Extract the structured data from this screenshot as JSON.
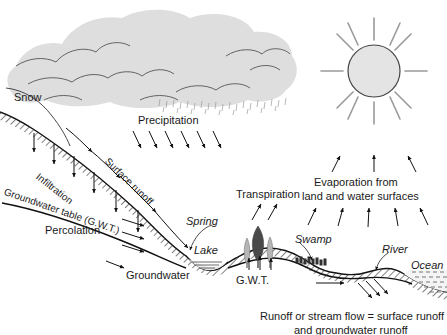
{
  "diagram": {
    "width": 447,
    "height": 335,
    "background_color": "#ffffff",
    "ink_color": "#1a1a1a"
  },
  "labels": {
    "snow": "Snow",
    "precipitation": "Precipitation",
    "infiltration": "Infiltration",
    "surface_runoff": "Surface runoff",
    "groundwater_table": "Groundwater table (G.W.T.)",
    "percolation": "Percolation",
    "groundwater": "Groundwater",
    "spring": "Spring",
    "lake": "Lake",
    "transpiration": "Transpiration",
    "evaporation_line1": "Evaporation from",
    "evaporation_line2": "land and water surfaces",
    "gwt_right": "G.W.T.",
    "swamp": "Swamp",
    "river": "River",
    "ocean": "Ocean",
    "caption_line1": "Runoff or stream flow = surface runoff",
    "caption_line2": "and groundwater runoff"
  },
  "elements": {
    "cloud": {
      "name": "cloud",
      "fill_color": "#dedede",
      "outline_color": "#555555"
    },
    "sun": {
      "name": "sun",
      "fill_color": "#e4e4e4",
      "outline_color": "#444444",
      "ray_color": "#9a9a9a",
      "ray_count": 12,
      "center_x": 374,
      "center_y": 71,
      "radius": 26
    },
    "trees": {
      "count": 3,
      "dark_color": "#4a4a4a",
      "light_color": "#b5b5b5"
    },
    "arrow_groups": {
      "precipitation_arrows": 6,
      "infiltration_arrows": 6,
      "percolation_arrows": 3,
      "transpiration_arrows": 2,
      "evaporation_upper_arrows": 3,
      "evaporation_lower_arrows": 5,
      "surface_runoff_arrows": 4,
      "gwt_hill_arrows": 3,
      "river_outlet_arrows": 3
    }
  }
}
